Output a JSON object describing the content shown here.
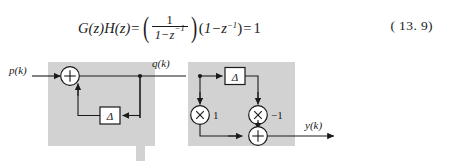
{
  "equation": {
    "lhs_g": "G(z)",
    "lhs_h": "H(z)",
    "equals": "=",
    "fraction_numerator": "1",
    "fraction_denominator_lead": "1−z",
    "fraction_denominator_exp": "−1",
    "group_open": "(",
    "group_lead": "1−z",
    "group_exp": "−1",
    "group_close": ")",
    "equals2": "=",
    "result": "1",
    "number": "( 13. 9)"
  },
  "diagram": {
    "type": "signal-flow-block-diagram",
    "block_fill": "#d2d2d2",
    "line_color": "#1a1a1a",
    "labels": {
      "input": "p(k)",
      "intermediate": "q(k)",
      "output": "y(k)",
      "delta_left": "Δ",
      "delta_right": "Δ",
      "gain_positive": "1",
      "gain_negative": "−1",
      "sum_left": "+",
      "sum_right": "+",
      "mult_left": "×",
      "mult_right": "×"
    },
    "left_block": {
      "name": "integrator-accumulator-G",
      "x": 48,
      "y": 14,
      "w": 107,
      "h": 84
    },
    "right_block": {
      "name": "differencer-H",
      "x": 188,
      "y": 14,
      "w": 107,
      "h": 84
    }
  }
}
